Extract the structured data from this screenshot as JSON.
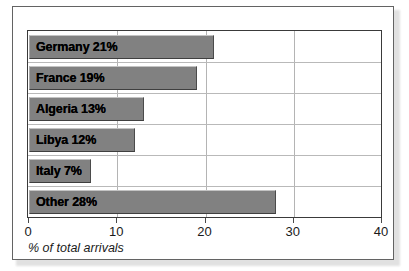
{
  "chart_data": {
    "type": "bar",
    "orientation": "horizontal",
    "title": "",
    "xlabel": "% of total arrivals",
    "ylabel": "",
    "xlim": [
      0,
      40
    ],
    "xticks": [
      0,
      10,
      20,
      30,
      40
    ],
    "xtick_labels": [
      "0",
      "10",
      "20",
      "30",
      "40"
    ],
    "grid": true,
    "legend": false,
    "categories": [
      "Germany",
      "France",
      "Algeria",
      "Libya",
      "Italy",
      "Other"
    ],
    "values": [
      21,
      19,
      13,
      12,
      7,
      28
    ],
    "bar_labels": [
      "Germany 21%",
      "France 19%",
      "Algeria 13%",
      "Libya 12%",
      "Italy 7%",
      "Other 28%"
    ],
    "bar_color": "#818181",
    "label_color": "#000000",
    "plot_background": "#ffffff",
    "gridline_color": "#b4b4b4",
    "frame_color": "#3a3a3a"
  }
}
